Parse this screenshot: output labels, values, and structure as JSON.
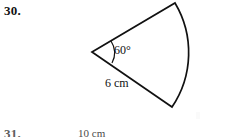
{
  "page": {
    "background_color": "#ffffff",
    "ink_color": "#111111",
    "width": 229,
    "height": 137
  },
  "problems": [
    {
      "number_label": "30.",
      "figure": {
        "type": "circular-sector",
        "angle_label": "60°",
        "radius_label": "6 cm",
        "angle_degrees": 60,
        "radius_value": 6,
        "radius_unit": "cm",
        "vertex": {
          "x": 92,
          "y": 52
        },
        "arc_start": {
          "x": 175,
          "y": 3
        },
        "arc_end": {
          "x": 172,
          "y": 107
        },
        "stroke_width": 1.6
      }
    },
    {
      "number_label": "31.",
      "figure": {
        "type": "partial-cropped-figure",
        "dimension_label": "10 cm"
      }
    }
  ]
}
